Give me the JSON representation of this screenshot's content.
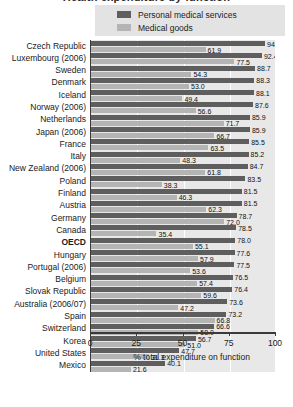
{
  "chart_data": {
    "type": "bar",
    "title": "Health expenditure by function",
    "orientation": "horizontal",
    "grid": true,
    "legend_position": "top",
    "xlabel": "% total expenditure on function",
    "ylabel": "",
    "xlim": [
      0,
      100
    ],
    "xticks": [
      0,
      25,
      50,
      75,
      100
    ],
    "xticklabels": [
      "0",
      "25",
      "50",
      "75",
      "100"
    ],
    "legend": [
      {
        "name": "Personal medical services",
        "color": "#5e5e5e"
      },
      {
        "name": "Medical goods",
        "color": "#b4b4b4"
      }
    ],
    "categories": [
      "Czech Republic",
      "Luxembourg (2006)",
      "Sweden",
      "Denmark",
      "Iceland",
      "Norway (2006)",
      "Netherlands",
      "Japan (2006)",
      "France",
      "Italy",
      "New Zealand (2006)",
      "Poland",
      "Finland",
      "Austria",
      "Germany",
      "Canada",
      "OECD",
      "Hungary",
      "Portugal (2006)",
      "Belgium",
      "Slovak Republic",
      "Australia (2006/07)",
      "Spain",
      "Switzerland",
      "Korea",
      "United States",
      "Mexico"
    ],
    "highlighted_category": "OECD",
    "series": [
      {
        "name": "Personal medical services",
        "color": "#5e5e5e",
        "values": [
          94.1,
          92.4,
          88.7,
          88.3,
          88.1,
          87.6,
          85.9,
          85.9,
          85.5,
          85.2,
          84.7,
          83.5,
          81.5,
          81.5,
          78.7,
          78.5,
          78.0,
          77.6,
          77.5,
          76.5,
          76.4,
          73.6,
          73.2,
          66.6,
          56.7,
          47.7,
          40.1
        ]
      },
      {
        "name": "Medical goods",
        "color": "#b4b4b4",
        "values": [
          61.9,
          77.5,
          54.3,
          53.0,
          49.4,
          56.6,
          71.7,
          66.7,
          63.5,
          48.3,
          61.8,
          38.3,
          46.3,
          62.3,
          72.0,
          35.4,
          55.1,
          57.9,
          53.6,
          57.4,
          59.6,
          47.2,
          66.8,
          58.0,
          51.0,
          31.3,
          21.6
        ]
      }
    ]
  }
}
